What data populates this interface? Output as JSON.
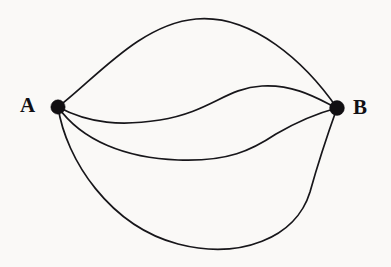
{
  "figure": {
    "background_color": "#faf9f7",
    "stroke_color": "#17161a",
    "vertex_color": "#110f12",
    "width": 391,
    "height": 267
  },
  "vertices": [
    {
      "id": "A",
      "label": "A",
      "cx": 58,
      "cy": 107,
      "r": 7.2,
      "label_position": "left"
    },
    {
      "id": "B",
      "label": "B",
      "cx": 337,
      "cy": 108,
      "r": 7.4,
      "label_position": "right"
    }
  ],
  "edges": [
    {
      "id": "edge-1",
      "from": "A",
      "to": "B",
      "description": "upper arc rising high above the vertices",
      "path": "M 58 107 C 96 78, 140 24, 196 19 C 252 14, 305 62, 337 108"
    },
    {
      "id": "edge-2",
      "from": "A",
      "to": "B",
      "description": "shallow S-curve dipping just below the vertex line then rising",
      "path": "M 58 107 C 90 124, 122 126, 160 120 C 210 112, 226 88, 262 86 C 296 84, 320 100, 337 108"
    },
    {
      "id": "edge-3",
      "from": "A",
      "to": "B",
      "description": "middle lower arc sagging to mid-height then sweeping up to B",
      "path": "M 58 107 C 82 141, 126 158, 178 160 C 228 162, 252 150, 276 134 C 300 120, 322 112, 337 108"
    },
    {
      "id": "edge-4",
      "from": "A",
      "to": "B",
      "description": "deep lower arc bowing to the bottom of the frame and bulging right before B",
      "path": "M 58 107 C 66 160, 110 226, 178 244 C 240 260, 296 238, 310 192 C 320 156, 332 122, 337 108"
    }
  ],
  "labels": {
    "vertex_a": "A",
    "vertex_b": "B"
  }
}
